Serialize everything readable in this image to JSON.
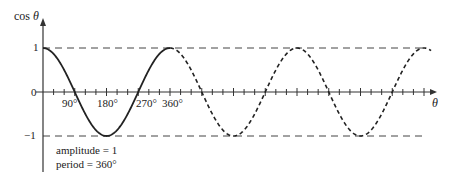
{
  "chart_data": {
    "type": "line",
    "title": "",
    "xlabel": "θ",
    "ylabel": "cos θ",
    "y_ticks": [
      "1",
      "0",
      "−1"
    ],
    "x_tick_labels": [
      "90°",
      "180°",
      "270°",
      "360°"
    ],
    "x_minor_tick_step_deg": 30,
    "xlim_deg": [
      0,
      1100
    ],
    "ylim": [
      -1,
      1
    ],
    "series": [
      {
        "name": "cos θ (first period)",
        "style": "solid",
        "x_deg": [
          0,
          90,
          180,
          270,
          360
        ],
        "values": [
          1,
          0,
          -1,
          0,
          1
        ]
      },
      {
        "name": "cos θ (continuation)",
        "style": "dashed",
        "x_deg": [
          360,
          450,
          540,
          630,
          720,
          810,
          900,
          990,
          1080
        ],
        "values": [
          1,
          0,
          -1,
          0,
          1,
          0,
          -1,
          0,
          1
        ]
      }
    ],
    "reference_lines": [
      {
        "y": 1,
        "style": "dashed"
      },
      {
        "y": -1,
        "style": "dashed"
      }
    ],
    "annotations": [
      "amplitude = 1",
      "period = 360°"
    ],
    "grid": false,
    "legend": null
  },
  "labels": {
    "ylabel_prefix": "cos ",
    "ylabel_var": "θ",
    "xlabel": "θ",
    "y1": "1",
    "y0": "0",
    "ym1": "−1",
    "x90": "90°",
    "x180": "180°",
    "x270": "270°",
    "x360": "360°",
    "amplitude": "amplitude = 1",
    "period": "period = 360°"
  }
}
